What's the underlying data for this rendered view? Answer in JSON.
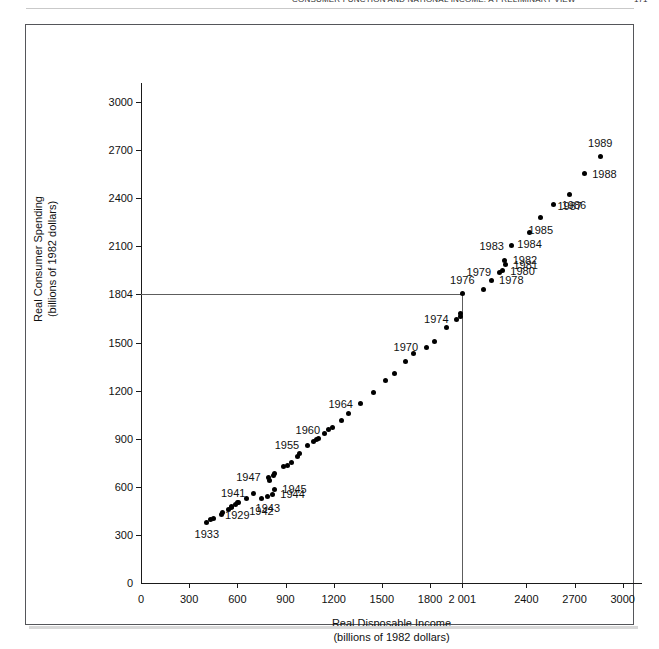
{
  "page": {
    "running_head": "CONSUMER FUNCTION AND NATIONAL INCOME: A PRELIMINARY VIEW",
    "folio": "171"
  },
  "chart_data": {
    "type": "scatter",
    "title": "",
    "xlabel": "Real Disposable Income",
    "xlabel_sub": "(billions of 1982 dollars)",
    "ylabel": "Real Consumer Spending",
    "ylabel_sub": "(billions of 1982 dollars)",
    "xlim": [
      0,
      3120
    ],
    "ylim": [
      0,
      3120
    ],
    "grid": false,
    "legend": null,
    "x_ticks": [
      {
        "value": 0,
        "label": "0"
      },
      {
        "value": 300,
        "label": "300"
      },
      {
        "value": 600,
        "label": "600"
      },
      {
        "value": 900,
        "label": "900"
      },
      {
        "value": 1200,
        "label": "1200"
      },
      {
        "value": 1500,
        "label": "1500"
      },
      {
        "value": 1800,
        "label": "1800"
      },
      {
        "value": 2001,
        "label": "2 001"
      },
      {
        "value": 2400,
        "label": "2400"
      },
      {
        "value": 2700,
        "label": "2700"
      },
      {
        "value": 3000,
        "label": "3000"
      }
    ],
    "y_ticks": [
      {
        "value": 0,
        "label": "0"
      },
      {
        "value": 300,
        "label": "300"
      },
      {
        "value": 600,
        "label": "600"
      },
      {
        "value": 900,
        "label": "900"
      },
      {
        "value": 1200,
        "label": "1200"
      },
      {
        "value": 1500,
        "label": "1500"
      },
      {
        "value": 1804,
        "label": "1804"
      },
      {
        "value": 2100,
        "label": "2100"
      },
      {
        "value": 2400,
        "label": "2400"
      },
      {
        "value": 2700,
        "label": "2700"
      },
      {
        "value": 3000,
        "label": "3000"
      }
    ],
    "reference_lines": [
      {
        "axis": "y",
        "value": 1804,
        "label": "1804",
        "to_x": 2001
      },
      {
        "axis": "x",
        "value": 2001,
        "label": "2 001",
        "to_y": 1804
      }
    ],
    "points": [
      {
        "year": "1929",
        "x": 600,
        "y": 500,
        "label": "1929",
        "pos": "b"
      },
      {
        "year": "1930",
        "x": 545,
        "y": 460,
        "label": "",
        "pos": ""
      },
      {
        "year": "1931",
        "x": 505,
        "y": 440,
        "label": "",
        "pos": ""
      },
      {
        "year": "1932",
        "x": 435,
        "y": 395,
        "label": "",
        "pos": ""
      },
      {
        "year": "1933",
        "x": 410,
        "y": 380,
        "label": "1933",
        "pos": "b"
      },
      {
        "year": "1934",
        "x": 450,
        "y": 405,
        "label": "",
        "pos": ""
      },
      {
        "year": "1935",
        "x": 500,
        "y": 430,
        "label": "",
        "pos": ""
      },
      {
        "year": "1936",
        "x": 565,
        "y": 470,
        "label": "",
        "pos": ""
      },
      {
        "year": "1937",
        "x": 590,
        "y": 490,
        "label": "",
        "pos": ""
      },
      {
        "year": "1938",
        "x": 565,
        "y": 480,
        "label": "",
        "pos": ""
      },
      {
        "year": "1939",
        "x": 610,
        "y": 505,
        "label": "",
        "pos": ""
      },
      {
        "year": "1940",
        "x": 655,
        "y": 530,
        "label": "",
        "pos": ""
      },
      {
        "year": "1941",
        "x": 700,
        "y": 560,
        "label": "1941",
        "pos": "r"
      },
      {
        "year": "1942",
        "x": 750,
        "y": 525,
        "label": "1942",
        "pos": "b"
      },
      {
        "year": "1943",
        "x": 790,
        "y": 540,
        "label": "1943",
        "pos": "b"
      },
      {
        "year": "1944",
        "x": 818,
        "y": 555,
        "label": "1944",
        "pos": "l"
      },
      {
        "year": "1945",
        "x": 830,
        "y": 585,
        "label": "1945",
        "pos": "l"
      },
      {
        "year": "1946",
        "x": 800,
        "y": 640,
        "label": "",
        "pos": ""
      },
      {
        "year": "1947",
        "x": 795,
        "y": 660,
        "label": "1947",
        "pos": "r"
      },
      {
        "year": "1948",
        "x": 825,
        "y": 670,
        "label": "",
        "pos": ""
      },
      {
        "year": "1949",
        "x": 830,
        "y": 685,
        "label": "",
        "pos": ""
      },
      {
        "year": "1950",
        "x": 890,
        "y": 730,
        "label": "",
        "pos": ""
      },
      {
        "year": "1951",
        "x": 910,
        "y": 735,
        "label": "",
        "pos": ""
      },
      {
        "year": "1952",
        "x": 940,
        "y": 755,
        "label": "",
        "pos": ""
      },
      {
        "year": "1953",
        "x": 975,
        "y": 790,
        "label": "",
        "pos": ""
      },
      {
        "year": "1954",
        "x": 985,
        "y": 805,
        "label": "",
        "pos": ""
      },
      {
        "year": "1955",
        "x": 1035,
        "y": 860,
        "label": "1955",
        "pos": "r"
      },
      {
        "year": "1956",
        "x": 1075,
        "y": 880,
        "label": "",
        "pos": ""
      },
      {
        "year": "1957",
        "x": 1095,
        "y": 895,
        "label": "",
        "pos": ""
      },
      {
        "year": "1958",
        "x": 1105,
        "y": 900,
        "label": "",
        "pos": ""
      },
      {
        "year": "1959",
        "x": 1140,
        "y": 935,
        "label": "",
        "pos": ""
      },
      {
        "year": "1960",
        "x": 1165,
        "y": 955,
        "label": "1960",
        "pos": "r"
      },
      {
        "year": "1961",
        "x": 1195,
        "y": 970,
        "label": "",
        "pos": ""
      },
      {
        "year": "1962",
        "x": 1250,
        "y": 1015,
        "label": "",
        "pos": ""
      },
      {
        "year": "1963",
        "x": 1295,
        "y": 1055,
        "label": "",
        "pos": ""
      },
      {
        "year": "1964",
        "x": 1370,
        "y": 1120,
        "label": "1964",
        "pos": "r"
      },
      {
        "year": "1965",
        "x": 1450,
        "y": 1190,
        "label": "",
        "pos": ""
      },
      {
        "year": "1966",
        "x": 1520,
        "y": 1265,
        "label": "",
        "pos": ""
      },
      {
        "year": "1967",
        "x": 1580,
        "y": 1305,
        "label": "",
        "pos": ""
      },
      {
        "year": "1968",
        "x": 1650,
        "y": 1380,
        "label": "",
        "pos": ""
      },
      {
        "year": "1969",
        "x": 1700,
        "y": 1430,
        "label": "",
        "pos": ""
      },
      {
        "year": "1970",
        "x": 1775,
        "y": 1470,
        "label": "1970",
        "pos": "r"
      },
      {
        "year": "1971",
        "x": 1830,
        "y": 1510,
        "label": "",
        "pos": ""
      },
      {
        "year": "1972",
        "x": 1900,
        "y": 1595,
        "label": "",
        "pos": ""
      },
      {
        "year": "1973",
        "x": 1990,
        "y": 1660,
        "label": "",
        "pos": ""
      },
      {
        "year": "1974",
        "x": 1965,
        "y": 1645,
        "label": "1974",
        "pos": "r"
      },
      {
        "year": "1975",
        "x": 1990,
        "y": 1680,
        "label": "",
        "pos": ""
      },
      {
        "year": "1976",
        "x": 2001,
        "y": 1804,
        "label": "1976",
        "pos": "t"
      },
      {
        "year": "1977",
        "x": 2130,
        "y": 1830,
        "label": "",
        "pos": ""
      },
      {
        "year": "1978",
        "x": 2180,
        "y": 1890,
        "label": "1978",
        "pos": "l"
      },
      {
        "year": "1979",
        "x": 2230,
        "y": 1940,
        "label": "1979",
        "pos": "r"
      },
      {
        "year": "1980",
        "x": 2250,
        "y": 1950,
        "label": "1980",
        "pos": "l"
      },
      {
        "year": "1981",
        "x": 2270,
        "y": 1985,
        "label": "1981",
        "pos": "l"
      },
      {
        "year": "1982",
        "x": 2265,
        "y": 2015,
        "label": "1982",
        "pos": "l"
      },
      {
        "year": "1983",
        "x": 2310,
        "y": 2105,
        "label": "1983",
        "pos": "r"
      },
      {
        "year": "1984",
        "x": 2420,
        "y": 2190,
        "label": "1984",
        "pos": "b"
      },
      {
        "year": "1985",
        "x": 2490,
        "y": 2280,
        "label": "1985",
        "pos": "b"
      },
      {
        "year": "1986",
        "x": 2570,
        "y": 2360,
        "label": "1986",
        "pos": "l"
      },
      {
        "year": "1987",
        "x": 2670,
        "y": 2425,
        "label": "1987",
        "pos": "b"
      },
      {
        "year": "1988",
        "x": 2760,
        "y": 2555,
        "label": "1988",
        "pos": "l"
      },
      {
        "year": "1989",
        "x": 2860,
        "y": 2660,
        "label": "1989",
        "pos": "t"
      }
    ]
  }
}
